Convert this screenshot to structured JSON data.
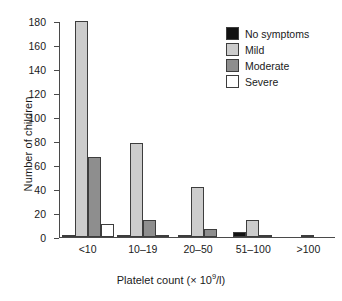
{
  "chart_data": {
    "type": "bar",
    "title": "",
    "subtitle": "",
    "xlabel": "Platelet count (× 10⁹/l)",
    "xlabel_parts": {
      "pre": "Platelet count (× 10",
      "sup": "9",
      "post": "/l)"
    },
    "ylabel": "Number of children",
    "categories": [
      "<10",
      "10–19",
      "20–50",
      "51–100",
      ">100"
    ],
    "series": [
      {
        "name": "No symptoms",
        "color": "#121212",
        "values": [
          2,
          2,
          1,
          4,
          0
        ]
      },
      {
        "name": "Mild",
        "color": "#cccccc",
        "values": [
          180,
          78,
          42,
          14,
          2
        ]
      },
      {
        "name": "Moderate",
        "color": "#8e8e8e",
        "values": [
          67,
          14,
          7,
          2,
          0
        ]
      },
      {
        "name": "Severe",
        "color": "#ffffff",
        "values": [
          11,
          1,
          0,
          0,
          0
        ]
      }
    ],
    "ylim": [
      0,
      180
    ],
    "yticks": [
      0,
      20,
      40,
      60,
      80,
      100,
      120,
      140,
      160,
      180
    ],
    "grid": false,
    "legend_position": "top-right",
    "legend_entries": [
      "No symptoms",
      "Mild",
      "Moderate",
      "Severe"
    ]
  }
}
